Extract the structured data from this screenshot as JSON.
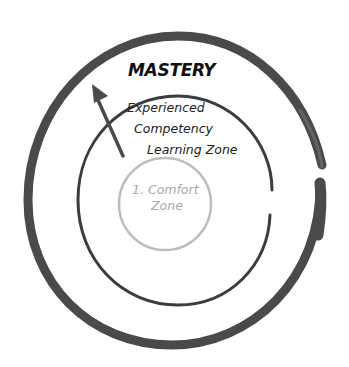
{
  "diagram": {
    "type": "concentric-spiral",
    "labels": {
      "mastery": "MASTERY",
      "experienced": "Experienced",
      "competency": "Competency",
      "learning_zone": "Learning Zone",
      "comfort_line1": "1. Comfort",
      "comfort_line2": "Zone"
    },
    "colors": {
      "outer_stroke": "#4a4a4a",
      "middle_stroke": "#3c3c3c",
      "inner_stroke": "#bdbdbd",
      "arrow": "#4a4a4a",
      "comfort_text": "#aaaaaa",
      "text": "#222222"
    },
    "arrow_icon": "arrow-up-left-icon"
  }
}
